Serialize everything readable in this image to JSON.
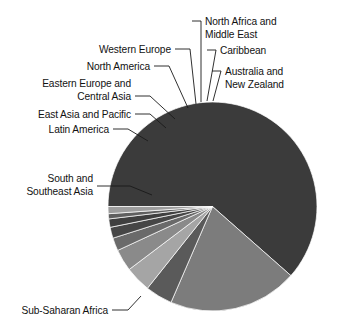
{
  "figure": {
    "background_color": "#ffffff",
    "text_color": "#121212",
    "leader_color": "#1a1a1a"
  },
  "chart_data": {
    "type": "pie",
    "title": "",
    "subtitle": "",
    "xlabel": "",
    "ylabel": "",
    "legend_position": "none",
    "labels_position": "outside-with-leader-lines",
    "grid": false,
    "start_angle_deg": 180,
    "direction": "counterclockwise",
    "categories": [
      "Sub-Saharan Africa",
      "South and Southeast Asia",
      "Latin America",
      "East Asia and Pacific",
      "Eastern Europe and Central Asia",
      "North America",
      "Western Europe",
      "North Africa and Middle East",
      "Caribbean",
      "Australia and New Zealand"
    ],
    "values": [
      61.5,
      20.0,
      4.2,
      4.0,
      3.4,
      2.0,
      1.7,
      1.3,
      0.8,
      1.1
    ],
    "unit": "percent",
    "slice_colors": [
      "#3b3b3b",
      "#7c7c7c",
      "#5a5a5a",
      "#a5a5a5",
      "#8a8a8a",
      "#6a6a6a",
      "#464646",
      "#3f3f3f",
      "#5f5f5f",
      "#9d9d9d"
    ]
  },
  "labels": {
    "sub_saharan_africa": "Sub-Saharan Africa",
    "south_southeast_asia_line1": "South and",
    "south_southeast_asia_line2": "Southeast Asia",
    "latin_america": "Latin America",
    "east_asia_pacific": "East Asia and Pacific",
    "eastern_europe_line1": "Eastern Europe and",
    "eastern_europe_line2": "Central Asia",
    "north_america": "North America",
    "western_europe": "Western Europe",
    "north_africa_line1": "North Africa and",
    "north_africa_line2": "Middle East",
    "caribbean": "Caribbean",
    "australia_line1": "Australia and",
    "australia_line2": "New Zealand"
  }
}
